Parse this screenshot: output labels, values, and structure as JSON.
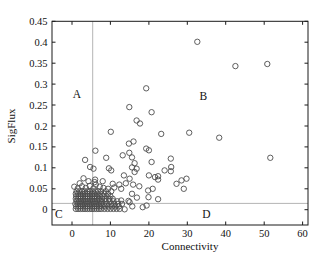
{
  "figure": {
    "background": "#ffffff",
    "quadrant_labels": [
      {
        "id": "A",
        "text": "A",
        "x": 1.3,
        "y": 0.276
      },
      {
        "id": "B",
        "text": "B",
        "x": 34.2,
        "y": 0.272
      },
      {
        "id": "C",
        "text": "C",
        "x": -3.4,
        "y": -0.01
      },
      {
        "id": "D",
        "text": "D",
        "x": 35.0,
        "y": -0.01
      }
    ]
  },
  "chart_data": {
    "type": "scatter",
    "title": "",
    "xlabel": "Connectivity",
    "ylabel": "SigFlux",
    "xlim": [
      -5.2,
      61.4
    ],
    "ylim": [
      -0.0365,
      0.45
    ],
    "grid": false,
    "legend": null,
    "axis_color": "#1a1a1a",
    "x_ticks": {
      "values": [
        0,
        10,
        20,
        30,
        40,
        50,
        60
      ],
      "labels": [
        "0",
        "10",
        "20",
        "30",
        "40",
        "50",
        "60"
      ]
    },
    "y_ticks": {
      "values": [
        0,
        0.05,
        0.1,
        0.15,
        0.2,
        0.25,
        0.3,
        0.35,
        0.4,
        0.45
      ],
      "labels": [
        "0",
        "0.05",
        "0.1",
        "0.15",
        "0.2",
        "0.25",
        "0.3",
        "0.35",
        "0.4",
        "0.45"
      ]
    },
    "reference_lines": {
      "vertical_x": 5.4,
      "horizontal_y": 0.015,
      "color": "#b4b4b4"
    },
    "marker": {
      "shape": "circle-open",
      "radius_px": 2.7,
      "stroke_width": 0.9,
      "color": "#4d4d4d",
      "fill": "none"
    },
    "points": [
      [
        1.0,
        0.002
      ],
      [
        1.6,
        0.002
      ],
      [
        2.2,
        0.002
      ],
      [
        2.8,
        0.002
      ],
      [
        3.4,
        0.002
      ],
      [
        4.0,
        0.002
      ],
      [
        4.6,
        0.002
      ],
      [
        5.2,
        0.002
      ],
      [
        5.8,
        0.002
      ],
      [
        6.4,
        0.002
      ],
      [
        7.0,
        0.002
      ],
      [
        7.6,
        0.002
      ],
      [
        8.4,
        0.002
      ],
      [
        9.2,
        0.002
      ],
      [
        10.0,
        0.002
      ],
      [
        10.8,
        0.002
      ],
      [
        11.6,
        0.002
      ],
      [
        12.4,
        0.002
      ],
      [
        1.1,
        0.008
      ],
      [
        1.7,
        0.008
      ],
      [
        2.3,
        0.008
      ],
      [
        2.9,
        0.008
      ],
      [
        3.5,
        0.008
      ],
      [
        4.1,
        0.008
      ],
      [
        4.7,
        0.008
      ],
      [
        5.3,
        0.008
      ],
      [
        5.9,
        0.008
      ],
      [
        6.5,
        0.008
      ],
      [
        7.1,
        0.008
      ],
      [
        7.7,
        0.008
      ],
      [
        8.6,
        0.008
      ],
      [
        9.5,
        0.008
      ],
      [
        10.4,
        0.008
      ],
      [
        11.3,
        0.008
      ],
      [
        12.2,
        0.008
      ],
      [
        0.9,
        0.014
      ],
      [
        1.5,
        0.014
      ],
      [
        2.1,
        0.014
      ],
      [
        2.7,
        0.014
      ],
      [
        3.3,
        0.014
      ],
      [
        3.9,
        0.014
      ],
      [
        4.5,
        0.014
      ],
      [
        5.1,
        0.014
      ],
      [
        5.7,
        0.014
      ],
      [
        6.3,
        0.014
      ],
      [
        6.9,
        0.014
      ],
      [
        7.5,
        0.014
      ],
      [
        8.3,
        0.014
      ],
      [
        9.1,
        0.014
      ],
      [
        10.2,
        0.014
      ],
      [
        11.0,
        0.014
      ],
      [
        12.0,
        0.014
      ],
      [
        13.0,
        0.014
      ],
      [
        1.2,
        0.02
      ],
      [
        1.8,
        0.02
      ],
      [
        2.4,
        0.02
      ],
      [
        3.0,
        0.02
      ],
      [
        3.6,
        0.02
      ],
      [
        4.2,
        0.02
      ],
      [
        4.8,
        0.02
      ],
      [
        5.4,
        0.02
      ],
      [
        6.0,
        0.02
      ],
      [
        6.6,
        0.02
      ],
      [
        7.2,
        0.02
      ],
      [
        7.8,
        0.02
      ],
      [
        8.8,
        0.02
      ],
      [
        9.8,
        0.02
      ],
      [
        10.8,
        0.02
      ],
      [
        11.8,
        0.02
      ],
      [
        1.0,
        0.026
      ],
      [
        1.6,
        0.026
      ],
      [
        2.2,
        0.026
      ],
      [
        2.8,
        0.026
      ],
      [
        3.4,
        0.026
      ],
      [
        4.0,
        0.026
      ],
      [
        4.6,
        0.026
      ],
      [
        5.2,
        0.026
      ],
      [
        5.8,
        0.026
      ],
      [
        6.4,
        0.026
      ],
      [
        7.0,
        0.026
      ],
      [
        7.8,
        0.026
      ],
      [
        8.6,
        0.026
      ],
      [
        9.6,
        0.026
      ],
      [
        10.6,
        0.026
      ],
      [
        1.1,
        0.032
      ],
      [
        1.7,
        0.032
      ],
      [
        2.3,
        0.032
      ],
      [
        2.9,
        0.032
      ],
      [
        3.5,
        0.032
      ],
      [
        4.1,
        0.032
      ],
      [
        4.7,
        0.032
      ],
      [
        5.3,
        0.032
      ],
      [
        5.9,
        0.032
      ],
      [
        6.5,
        0.032
      ],
      [
        7.2,
        0.032
      ],
      [
        8.0,
        0.032
      ],
      [
        9.0,
        0.032
      ],
      [
        10.0,
        0.032
      ],
      [
        1.0,
        0.038
      ],
      [
        1.6,
        0.038
      ],
      [
        2.2,
        0.038
      ],
      [
        2.8,
        0.038
      ],
      [
        3.4,
        0.038
      ],
      [
        4.0,
        0.038
      ],
      [
        4.6,
        0.038
      ],
      [
        5.2,
        0.038
      ],
      [
        5.8,
        0.038
      ],
      [
        6.6,
        0.038
      ],
      [
        7.4,
        0.038
      ],
      [
        8.4,
        0.038
      ],
      [
        9.4,
        0.038
      ],
      [
        1.2,
        0.044
      ],
      [
        1.9,
        0.044
      ],
      [
        2.6,
        0.044
      ],
      [
        3.3,
        0.044
      ],
      [
        4.0,
        0.044
      ],
      [
        4.7,
        0.044
      ],
      [
        5.4,
        0.044
      ],
      [
        6.1,
        0.044
      ],
      [
        6.8,
        0.044
      ],
      [
        7.6,
        0.044
      ],
      [
        8.8,
        0.044
      ],
      [
        10.2,
        0.044
      ],
      [
        1.5,
        0.051
      ],
      [
        2.6,
        0.056
      ],
      [
        3.6,
        0.052
      ],
      [
        4.6,
        0.057
      ],
      [
        5.6,
        0.051
      ],
      [
        6.2,
        0.06
      ],
      [
        7.2,
        0.055
      ],
      [
        8.2,
        0.052
      ],
      [
        9.4,
        0.05
      ],
      [
        11.0,
        0.053
      ],
      [
        12.3,
        0.06
      ],
      [
        5.9,
        0.066
      ],
      [
        6.0,
        0.072
      ],
      [
        4.3,
        0.068
      ],
      [
        2.0,
        0.063
      ],
      [
        0.6,
        0.055
      ],
      [
        3.0,
        0.075
      ],
      [
        8.0,
        0.068
      ],
      [
        12.8,
        0.05
      ],
      [
        10.6,
        0.062
      ],
      [
        32.6,
        0.401
      ],
      [
        50.8,
        0.348
      ],
      [
        42.5,
        0.343
      ],
      [
        19.3,
        0.29
      ],
      [
        14.9,
        0.245
      ],
      [
        20.7,
        0.233
      ],
      [
        16.8,
        0.213
      ],
      [
        17.7,
        0.206
      ],
      [
        10.1,
        0.186
      ],
      [
        23.2,
        0.181
      ],
      [
        30.5,
        0.184
      ],
      [
        38.3,
        0.172
      ],
      [
        16.0,
        0.163
      ],
      [
        14.8,
        0.158
      ],
      [
        19.3,
        0.146
      ],
      [
        14.9,
        0.136
      ],
      [
        13.2,
        0.13
      ],
      [
        6.1,
        0.141
      ],
      [
        51.6,
        0.124
      ],
      [
        25.7,
        0.122
      ],
      [
        8.9,
        0.124
      ],
      [
        3.4,
        0.119
      ],
      [
        15.6,
        0.125
      ],
      [
        20.0,
        0.142
      ],
      [
        16.3,
        0.111
      ],
      [
        20.7,
        0.114
      ],
      [
        25.8,
        0.102
      ],
      [
        4.7,
        0.102
      ],
      [
        5.6,
        0.098
      ],
      [
        9.6,
        0.099
      ],
      [
        10.2,
        0.094
      ],
      [
        15.6,
        0.101
      ],
      [
        16.8,
        0.098
      ],
      [
        24.1,
        0.094
      ],
      [
        16.3,
        0.09
      ],
      [
        25.7,
        0.092
      ],
      [
        13.5,
        0.082
      ],
      [
        15.0,
        0.074
      ],
      [
        20.0,
        0.082
      ],
      [
        21.6,
        0.078
      ],
      [
        22.4,
        0.08
      ],
      [
        22.4,
        0.072
      ],
      [
        29.8,
        0.074
      ],
      [
        28.5,
        0.07
      ],
      [
        27.2,
        0.062
      ],
      [
        29.1,
        0.05
      ],
      [
        21.0,
        0.05
      ],
      [
        15.9,
        0.06
      ],
      [
        17.5,
        0.056
      ],
      [
        19.8,
        0.046
      ],
      [
        15.6,
        0.038
      ],
      [
        16.9,
        0.029
      ],
      [
        15.0,
        0.018
      ],
      [
        22.4,
        0.025
      ],
      [
        18.4,
        0.006
      ],
      [
        19.4,
        0.01
      ],
      [
        14.0,
        0.063
      ],
      [
        19.9,
        0.03
      ],
      [
        12.8,
        0.022
      ],
      [
        14.7,
        0.021
      ],
      [
        15.7,
        0.008
      ],
      [
        13.7,
        0.001
      ]
    ]
  }
}
